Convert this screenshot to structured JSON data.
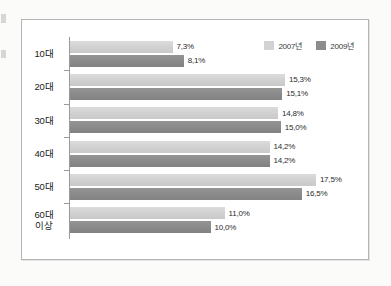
{
  "chart_data": {
    "type": "bar",
    "orientation": "horizontal",
    "title": "",
    "subtitle": "",
    "xlabel": "",
    "ylabel": "",
    "xlim": [
      0,
      18
    ],
    "grid": false,
    "legend_position": "top-right",
    "value_suffix": "%",
    "categories": [
      "10대",
      "20대",
      "30대",
      "40대",
      "50대",
      "60대 이상"
    ],
    "category_lines": [
      [
        "10대"
      ],
      [
        "20대"
      ],
      [
        "30대"
      ],
      [
        "40대"
      ],
      [
        "50대"
      ],
      [
        "60대",
        "이상"
      ]
    ],
    "series": [
      {
        "name": "2007년",
        "color": "#d2d2d2",
        "values": [
          7.3,
          15.3,
          14.8,
          14.2,
          17.5,
          11.0
        ],
        "labels": [
          "7,3%",
          "15,3%",
          "14,8%",
          "14,2%",
          "17,5%",
          "11,0%"
        ]
      },
      {
        "name": "2009년",
        "color": "#8c8c8c",
        "values": [
          8.1,
          15.1,
          15.0,
          14.2,
          16.5,
          10.0
        ],
        "labels": [
          "8,1%",
          "15,1%",
          "15,0%",
          "14,2%",
          "16,5%",
          "10,0%"
        ]
      }
    ]
  },
  "legend": {
    "items": [
      {
        "label": "2007년",
        "color": "#d2d2d2"
      },
      {
        "label": "2009년",
        "color": "#8c8c8c"
      }
    ]
  },
  "colors": {
    "series_2007": "#d2d2d2",
    "series_2009": "#8c8c8c",
    "axis": "#9a9a9a",
    "frame_border": "#b4b4b4",
    "page_background": "#fbfbfa",
    "plot_background": "#ffffff",
    "label_text": "#1a1a1a"
  }
}
